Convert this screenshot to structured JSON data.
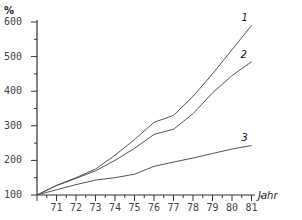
{
  "chart_data": {
    "type": "line",
    "title": "",
    "xlabel": "Jahr",
    "ylabel": "%",
    "x": [
      1970,
      1971,
      1972,
      1973,
      1974,
      1975,
      1976,
      1977,
      1978,
      1979,
      1980,
      1981
    ],
    "x_tick_labels": [
      "71",
      "72",
      "73",
      "74",
      "75",
      "76",
      "77",
      "78",
      "79",
      "80",
      "81"
    ],
    "y_tick_labels": [
      "100",
      "200",
      "300",
      "400",
      "500",
      "600"
    ],
    "ylim": [
      100,
      600
    ],
    "xlim": [
      1970,
      1981.8
    ],
    "grid": false,
    "legend": "inline labels at line ends",
    "series": [
      {
        "name": "1",
        "values": [
          100,
          128,
          150,
          175,
          215,
          260,
          310,
          330,
          385,
          450,
          520,
          590
        ]
      },
      {
        "name": "2",
        "values": [
          100,
          127,
          148,
          170,
          200,
          235,
          275,
          290,
          335,
          395,
          445,
          485
        ]
      },
      {
        "name": "3",
        "values": [
          100,
          115,
          130,
          143,
          150,
          160,
          183,
          195,
          207,
          220,
          233,
          243
        ]
      }
    ]
  },
  "colors": {
    "line": "#555555",
    "axis": "#333333"
  }
}
